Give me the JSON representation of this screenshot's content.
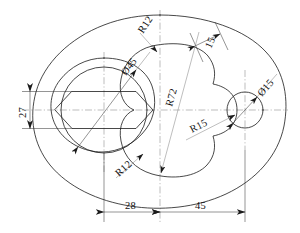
{
  "drawing": {
    "type": "engineering-drawing",
    "title": "Oval plate with hex recess, kidney slot and bore",
    "units": "mm",
    "line_colors": {
      "object": "#1b1b1b",
      "centerline": "#6e6e6e",
      "dimension": "#2a2a2a",
      "leader": "#7d7d7d"
    },
    "dimensions": [
      {
        "id": "dia45",
        "label": "Ø45",
        "kind": "diameter",
        "value": 45,
        "feature": "hex-recess-circumscribed-circle",
        "orientation": "diagonal"
      },
      {
        "id": "r12top",
        "label": "R12",
        "kind": "radius",
        "value": 12,
        "feature": "kidney-upper-left-fillet",
        "orientation": "diagonal"
      },
      {
        "id": "len15",
        "label": "15",
        "kind": "linear",
        "value": 15,
        "feature": "kidney-upper-right-notch-width",
        "orientation": "diagonal"
      },
      {
        "id": "dia15",
        "label": "Ø15",
        "kind": "diameter",
        "value": 15,
        "feature": "right-bore",
        "orientation": "diagonal"
      },
      {
        "id": "r72",
        "label": "R72",
        "kind": "radius",
        "value": 72,
        "feature": "kidney-major-arc",
        "orientation": "diagonal"
      },
      {
        "id": "r15",
        "label": "R15",
        "kind": "radius",
        "value": 15,
        "feature": "kidney-right-concave-arc",
        "orientation": "diagonal"
      },
      {
        "id": "r12bot",
        "label": "R12",
        "kind": "radius",
        "value": 12,
        "feature": "kidney-lower-left-fillet",
        "orientation": "diagonal"
      },
      {
        "id": "h27",
        "label": "27",
        "kind": "linear",
        "value": 27,
        "feature": "hex-across-flats-height",
        "orientation": "vertical"
      },
      {
        "id": "w28",
        "label": "28",
        "kind": "linear",
        "value": 28,
        "feature": "hex-center-to-vertical-centerline",
        "orientation": "horizontal"
      },
      {
        "id": "w45",
        "label": "45",
        "kind": "linear",
        "value": 45,
        "feature": "vertical-centerline-to-bore-center",
        "orientation": "horizontal"
      }
    ],
    "features": [
      {
        "name": "outer-oval-contour",
        "shape": "oval"
      },
      {
        "name": "hex-recess-boss",
        "shape": "rounded-oval"
      },
      {
        "name": "hex-recess-circle",
        "shape": "circle"
      },
      {
        "name": "hexagon-recess",
        "shape": "hexagon",
        "vertices": 6
      },
      {
        "name": "kidney-slot",
        "shape": "bean"
      },
      {
        "name": "right-bore-circle",
        "shape": "circle"
      }
    ],
    "centerlines": [
      {
        "name": "horizontal-centerline",
        "orientation": "horizontal"
      },
      {
        "name": "vertical-centerline",
        "orientation": "vertical"
      },
      {
        "name": "hex-vertical-centerline",
        "orientation": "vertical"
      },
      {
        "name": "bore-vertical-centerline",
        "orientation": "vertical"
      }
    ]
  }
}
